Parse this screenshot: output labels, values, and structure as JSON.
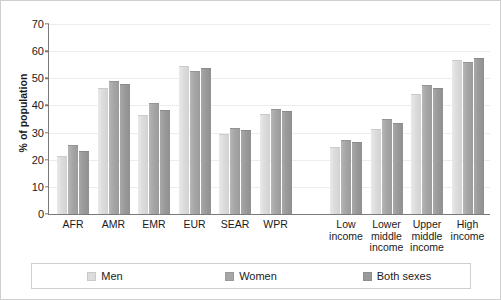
{
  "chart_data": {
    "type": "bar",
    "title": "",
    "xlabel": "",
    "ylabel": "% of population",
    "ylim": [
      0,
      70
    ],
    "yticks": [
      0,
      10,
      20,
      30,
      40,
      50,
      60,
      70
    ],
    "grid": true,
    "legend_position": "bottom",
    "categories": [
      "AFR",
      "AMR",
      "EMR",
      "EUR",
      "SEAR",
      "WPR",
      "Low\nincome",
      "Lower\nmiddle\nincome",
      "Upper\nmiddle\nincome",
      "High\nincome"
    ],
    "series": [
      {
        "name": "Men",
        "color": "#dcdcdc",
        "values": [
          21.0,
          46.0,
          36.0,
          54.0,
          29.0,
          36.5,
          24.5,
          31.0,
          44.0,
          56.5
        ]
      },
      {
        "name": "Women",
        "color": "#a6a6a6",
        "values": [
          25.0,
          48.5,
          40.5,
          52.5,
          31.5,
          38.5,
          27.0,
          34.5,
          47.0,
          55.5
        ]
      },
      {
        "name": "Both sexes",
        "color": "#9a9a9a",
        "values": [
          23.0,
          47.5,
          38.0,
          53.5,
          30.5,
          37.5,
          26.0,
          33.0,
          46.0,
          57.0
        ]
      }
    ]
  },
  "legend": {
    "items": [
      {
        "label": "Men",
        "swatch": "men-swatch"
      },
      {
        "label": "Women",
        "swatch": "women-swatch"
      },
      {
        "label": "Both sexes",
        "swatch": "both-sexes-swatch"
      }
    ]
  }
}
